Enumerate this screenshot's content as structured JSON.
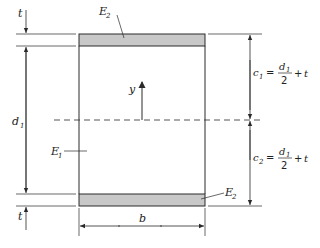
{
  "diagram": {
    "labels": {
      "top_t": "t",
      "bottom_t": "t",
      "d1_main": "d",
      "d1_sub": "1",
      "y_axis": "y",
      "E1_main": "E",
      "E1_sub": "1",
      "E2_top_main": "E",
      "E2_top_sub": "2",
      "E2_bottom_main": "E",
      "E2_bottom_sub": "2",
      "b": "b"
    },
    "equations": {
      "c1": {
        "lhs_main": "c",
        "lhs_sub": "1",
        "equals": "=",
        "num_main": "d",
        "num_sub": "1",
        "den": "2",
        "plus": "+",
        "t": "t"
      },
      "c2": {
        "lhs_main": "c",
        "lhs_sub": "2",
        "equals": "=",
        "num_main": "d",
        "num_sub": "1",
        "den": "2",
        "plus": "+",
        "t": "t"
      }
    },
    "colors": {
      "line": "#2a2a2a",
      "flange_fill": "#c8c8c8",
      "background": "#ffffff"
    }
  }
}
